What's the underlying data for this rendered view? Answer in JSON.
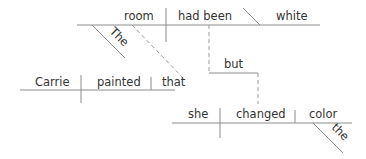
{
  "diagram": {
    "type": "sentence-diagram",
    "sentence": "Carrie painted that the room had been white but she changed the color",
    "main_clause": {
      "subject": "room",
      "subject_modifier": "The",
      "verb": "had been",
      "complement": "white"
    },
    "noun_clause": {
      "subject": "Carrie",
      "verb": "painted",
      "object": "that"
    },
    "conjunction": "but",
    "second_clause": {
      "subject": "she",
      "verb": "changed",
      "object": "color",
      "object_modifier": "the"
    },
    "colors": {
      "line": "#8c8c8c",
      "text": "#333333",
      "background": "#ffffff"
    }
  }
}
